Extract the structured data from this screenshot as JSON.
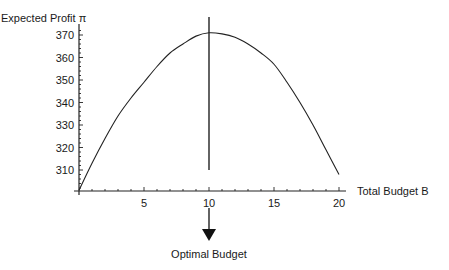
{
  "chart_data": {
    "type": "line",
    "title": "",
    "ylabel": "Expected Profit π",
    "xlabel": "Total Budget B",
    "x_ticks": [
      5,
      10,
      15,
      20
    ],
    "y_ticks": [
      310,
      320,
      330,
      340,
      350,
      360,
      370
    ],
    "xlim": [
      0,
      20
    ],
    "ylim": [
      300.5,
      372
    ],
    "grid": false,
    "series": [
      {
        "name": "Expected Profit",
        "x": [
          0,
          1,
          2,
          3,
          4,
          5,
          6,
          7,
          8,
          9,
          10,
          11,
          12,
          13,
          14,
          15,
          16,
          17,
          18,
          19,
          20
        ],
        "values": [
          301,
          313,
          324,
          334,
          342,
          349,
          356,
          362,
          366,
          369.5,
          371,
          370.5,
          369,
          366,
          362,
          357,
          349,
          340,
          330,
          319,
          308
        ]
      }
    ],
    "annotations": [
      {
        "type": "vline",
        "x": 10,
        "label": ""
      },
      {
        "type": "arrow",
        "x": 10,
        "direction": "down",
        "label": "Optimal Budget"
      }
    ]
  }
}
